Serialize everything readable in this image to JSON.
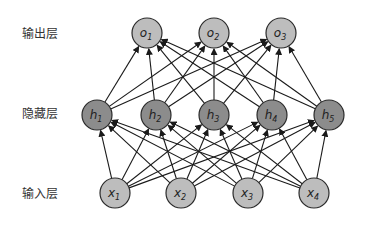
{
  "diagram": {
    "type": "neural-network-mlp",
    "colors": {
      "background": "#ffffff",
      "edge": "#1a1a1a",
      "node_stroke": "#2a2a2a",
      "io_node_fill": "#bdbdbd",
      "hidden_node_fill": "#8c8c8c"
    },
    "node_radius": 15,
    "layers": [
      {
        "id": "output",
        "label": "输出层",
        "label_pos": [
          22,
          38
        ],
        "y": 33,
        "fill_key": "io_node_fill",
        "nodes": [
          {
            "id": "o1",
            "base": "o",
            "sub": "1",
            "x": 147
          },
          {
            "id": "o2",
            "base": "o",
            "sub": "2",
            "x": 214
          },
          {
            "id": "o3",
            "base": "o",
            "sub": "3",
            "x": 281
          }
        ]
      },
      {
        "id": "hidden",
        "label": "隐藏层",
        "label_pos": [
          22,
          118
        ],
        "y": 115,
        "fill_key": "hidden_node_fill",
        "nodes": [
          {
            "id": "h1",
            "base": "h",
            "sub": "1",
            "x": 97
          },
          {
            "id": "h2",
            "base": "h",
            "sub": "2",
            "x": 156
          },
          {
            "id": "h3",
            "base": "h",
            "sub": "3",
            "x": 214
          },
          {
            "id": "h4",
            "base": "h",
            "sub": "4",
            "x": 272
          },
          {
            "id": "h5",
            "base": "h",
            "sub": "5",
            "x": 329
          }
        ]
      },
      {
        "id": "input",
        "label": "输入层",
        "label_pos": [
          22,
          198
        ],
        "y": 193,
        "fill_key": "io_node_fill",
        "nodes": [
          {
            "id": "x1",
            "base": "x",
            "sub": "1",
            "x": 115
          },
          {
            "id": "x2",
            "base": "x",
            "sub": "2",
            "x": 181
          },
          {
            "id": "x3",
            "base": "x",
            "sub": "3",
            "x": 248
          },
          {
            "id": "x4",
            "base": "x",
            "sub": "4",
            "x": 314
          }
        ]
      }
    ],
    "connections": [
      {
        "from": "input",
        "to": "hidden",
        "fully_connected": true,
        "arrow": true
      },
      {
        "from": "hidden",
        "to": "output",
        "fully_connected": true,
        "arrow": true
      }
    ]
  }
}
